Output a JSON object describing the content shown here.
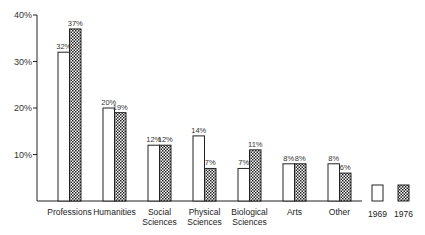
{
  "chart_data": {
    "type": "bar",
    "title": "",
    "xlabel": "",
    "ylabel": "",
    "ylim": [
      0,
      40
    ],
    "yticks": [
      "10%",
      "20%",
      "30%",
      "40%"
    ],
    "grid": false,
    "categories": [
      "Professions",
      "Humanities",
      "Social Sciences",
      "Physical Sciences",
      "Biological Sciences",
      "Arts",
      "Other"
    ],
    "category_lines": [
      [
        "Professions"
      ],
      [
        "Humanities"
      ],
      [
        "Social",
        "Sciences"
      ],
      [
        "Physical",
        "Sciences"
      ],
      [
        "Biological",
        "Sciences"
      ],
      [
        "Arts"
      ],
      [
        "Other"
      ]
    ],
    "series": [
      {
        "name": "1969",
        "values": [
          32,
          20,
          12,
          14,
          7,
          8,
          8
        ],
        "labels": [
          "32%",
          "20%",
          "12%",
          "14%",
          "7%",
          "8%",
          "8%"
        ],
        "fill": "white"
      },
      {
        "name": "1976",
        "values": [
          37,
          19,
          12,
          7,
          11,
          8,
          6
        ],
        "labels": [
          "37%",
          "19%",
          "12%",
          "7%",
          "11%",
          "8%",
          "6%"
        ],
        "fill": "crosshatch"
      }
    ],
    "legend": {
      "position": "bottom-right",
      "entries": [
        "1969",
        "1976"
      ]
    }
  }
}
